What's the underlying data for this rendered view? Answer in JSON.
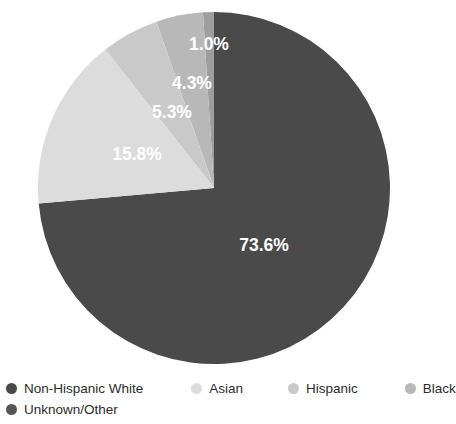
{
  "chart_data": {
    "type": "pie",
    "title": "",
    "subtitle": "",
    "xlabel": "",
    "ylabel": "",
    "grid": false,
    "legend_position": "bottom",
    "start_angle_deg": 0,
    "direction": "clockwise",
    "center": {
      "x": 214,
      "y": 188
    },
    "radius": 176,
    "categories": [
      "Non-Hispanic White",
      "Asian",
      "Hispanic",
      "Black",
      "Unknown/Other"
    ],
    "values": [
      73.6,
      15.8,
      5.3,
      4.3,
      1.0
    ],
    "labels": [
      "73.6%",
      "15.8%",
      "5.3%",
      "4.3%",
      "1.0%"
    ],
    "colors": [
      "#4a4a4a",
      "#dcdcdc",
      "#c9c9c9",
      "#b8b8b8",
      "#9e9e9e"
    ],
    "label_color": "#ffffff",
    "slices": [
      {
        "name": "Non-Hispanic White",
        "value": 73.6,
        "label": "73.6%",
        "color": "#4a4a4a",
        "label_x": 264,
        "label_y": 246
      },
      {
        "name": "Asian",
        "value": 15.8,
        "label": "15.8%",
        "color": "#dcdcdc",
        "label_x": 137,
        "label_y": 155
      },
      {
        "name": "Hispanic",
        "value": 5.3,
        "label": "5.3%",
        "color": "#c9c9c9",
        "label_x": 172,
        "label_y": 113
      },
      {
        "name": "Black",
        "value": 4.3,
        "label": "4.3%",
        "color": "#b8b8b8",
        "label_x": 192,
        "label_y": 84
      },
      {
        "name": "Unknown/Other",
        "value": 1.0,
        "label": "1.0%",
        "color": "#9e9e9e",
        "label_x": 209,
        "label_y": 45
      }
    ]
  },
  "legend": {
    "row1": [
      {
        "label": "Non-Hispanic White",
        "color": "#4a4a4a"
      },
      {
        "label": "Asian",
        "color": "#dcdcdc"
      },
      {
        "label": "Hispanic",
        "color": "#c9c9c9"
      },
      {
        "label": "Black",
        "color": "#b8b8b8"
      }
    ],
    "row2": [
      {
        "label": "Unknown/Other",
        "color": "#565656"
      }
    ]
  }
}
